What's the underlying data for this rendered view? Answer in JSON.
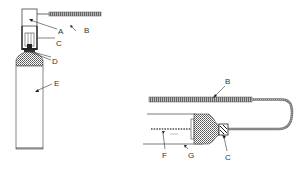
{
  "diagram": {
    "type": "technical-illustration",
    "colors": {
      "ink": "#3a3a3a",
      "hatch": "#8a8a8a",
      "background": "#ffffff"
    },
    "left_view": {
      "labels": [
        {
          "id": "A",
          "text": "A"
        },
        {
          "id": "B",
          "text": "B"
        },
        {
          "id": "C",
          "text": "C"
        },
        {
          "id": "D",
          "text": "D"
        },
        {
          "id": "E",
          "text": "E"
        }
      ]
    },
    "right_view": {
      "labels": [
        {
          "id": "B",
          "text": "B"
        },
        {
          "id": "C",
          "text": "C"
        },
        {
          "id": "F",
          "text": "F"
        },
        {
          "id": "G",
          "text": "G"
        }
      ]
    }
  }
}
